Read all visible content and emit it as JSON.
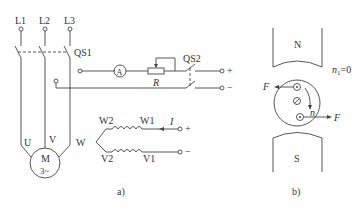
{
  "figure_a": {
    "caption": "a)",
    "phase_labels": [
      "L1",
      "L2",
      "L3"
    ],
    "main_switch": "QS1",
    "dc_switch": "QS2",
    "ammeter": "A",
    "resistor": "R",
    "motor": {
      "name": "M",
      "type": "3~"
    },
    "motor_terminals": [
      "U",
      "V",
      "W"
    ],
    "windings": {
      "top_left": "W2",
      "top_right": "W1",
      "bottom_left": "V2",
      "bottom_right": "V1"
    },
    "current_label": "I",
    "dc_plus": "+",
    "dc_minus": "−"
  },
  "figure_b": {
    "caption": "b)",
    "north": "N",
    "south": "S",
    "speed_label": "n",
    "speed_sub": "1",
    "speed_value": "=0",
    "rotation_label": "n",
    "force_label": "F"
  }
}
